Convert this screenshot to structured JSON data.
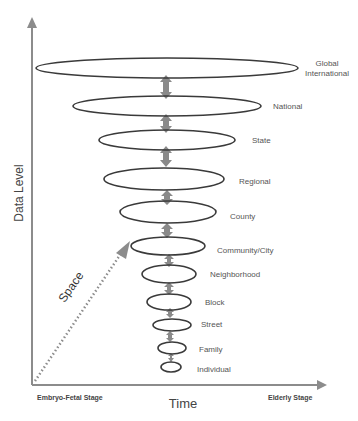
{
  "diagram": {
    "y_axis_label": "Data Level",
    "x_axis_label": "Time",
    "diagonal_label": "Space",
    "x_start_label": "Embryo-Fetal Stage",
    "x_end_label": "Elderly Stage",
    "colors": {
      "axis": "#8c8c8c",
      "ellipse": "#3a3a3a",
      "arrow": "#8a8a8a",
      "text": "#555555"
    },
    "levels": [
      {
        "label_line1": "Global",
        "label_line2": "International"
      },
      {
        "label": "National"
      },
      {
        "label": "State"
      },
      {
        "label": "Regional"
      },
      {
        "label": "County"
      },
      {
        "label": "Community/City"
      },
      {
        "label": "Neighborhood"
      },
      {
        "label": "Block"
      },
      {
        "label": "Street"
      },
      {
        "label": "Family"
      },
      {
        "label": "Individual"
      }
    ]
  }
}
